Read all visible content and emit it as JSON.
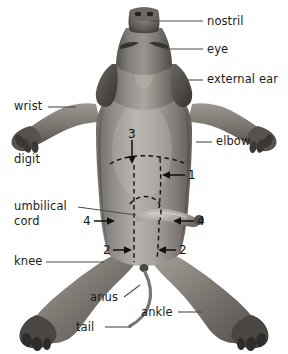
{
  "figure": {
    "background_color": "#ffffff",
    "text_color": "#1c1c1c",
    "leader_color": "#4d4d4d",
    "incision_color": "#111111"
  },
  "labels": {
    "nostril": "nostril",
    "eye": "eye",
    "external_ear": "external ear",
    "elbow": "elbow",
    "wrist": "wrist",
    "digit": "digit",
    "umbilical_cord_line1": "umbilical",
    "umbilical_cord_line2": "cord",
    "knee": "knee",
    "anus": "anus",
    "ankle": "ankle",
    "tail": "tail"
  },
  "incision_markers": {
    "three": "3",
    "one": "1",
    "four_left": "4",
    "four_right": "4",
    "two_left": "2",
    "two_right": "2"
  }
}
